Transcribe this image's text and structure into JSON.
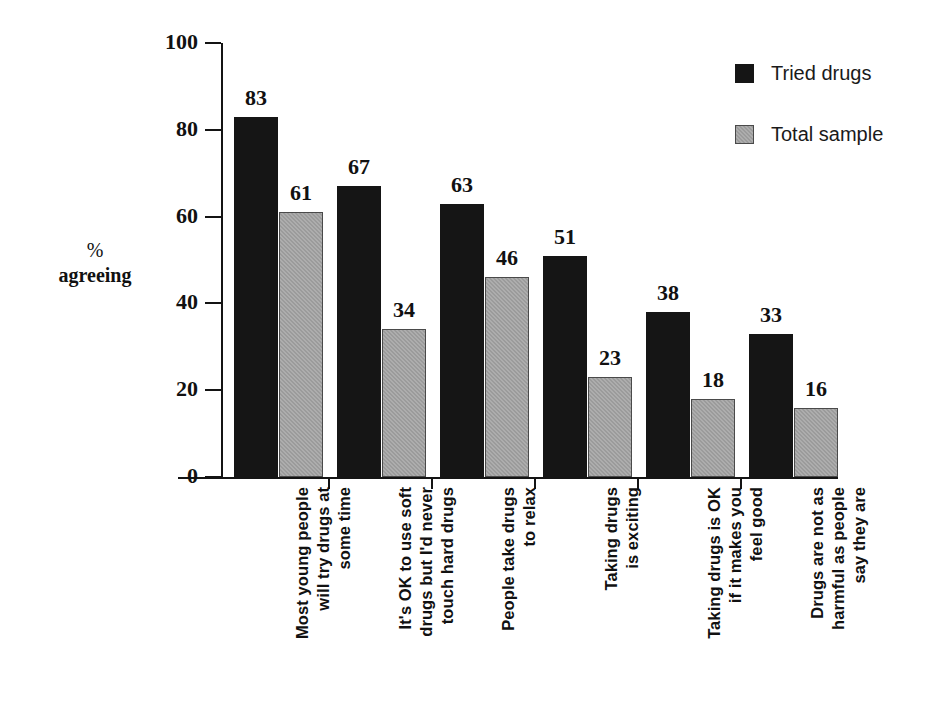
{
  "chart_data": {
    "type": "bar",
    "title": "",
    "xlabel": "",
    "ylabel": "%\nagreeing",
    "ylabel_line1": "%",
    "ylabel_line2": "agreeing",
    "ylim": [
      0,
      100
    ],
    "yticks": [
      0,
      20,
      40,
      60,
      80,
      100
    ],
    "ytick_labels": [
      "0",
      "20",
      "40",
      "60",
      "80",
      "100"
    ],
    "grid": false,
    "legend_position": "top-right",
    "categories": [
      "Most young people\nwill try drugs at\nsome time",
      "It's OK to use soft\ndrugs but I'd never\ntouch hard drugs",
      "People take drugs\nto relax",
      "Taking drugs\nis exciting",
      "Taking drugs is OK\nif it makes you\nfeel good",
      "Drugs are not as\nharmful as people\nsay they are"
    ],
    "series": [
      {
        "name": "Tried drugs",
        "color": "#151515",
        "values": [
          83,
          67,
          63,
          51,
          38,
          33
        ]
      },
      {
        "name": "Total sample",
        "color": "#9b9b9b",
        "values": [
          61,
          34,
          46,
          23,
          18,
          16
        ]
      }
    ]
  },
  "legend": {
    "items": [
      {
        "label": "Tried drugs",
        "swatch": "dark"
      },
      {
        "label": "Total sample",
        "swatch": "grey"
      }
    ]
  }
}
